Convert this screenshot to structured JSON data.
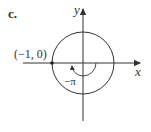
{
  "figure": {
    "part_label": "c.",
    "axes": {
      "x_label": "x",
      "y_label": "y"
    },
    "circle": {
      "description": "unit circle centered at origin"
    },
    "point": {
      "label": "(−1, 0)",
      "coords": [
        -1,
        0
      ]
    },
    "angle": {
      "label": "−π",
      "direction": "clockwise",
      "value": "-pi"
    },
    "colors": {
      "stroke": "#333333",
      "background": "#ffffff"
    }
  }
}
